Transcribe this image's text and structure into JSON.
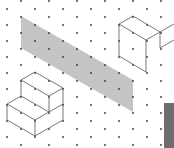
{
  "diagram": {
    "type": "isometric-dot-grid",
    "background": "#ffffff",
    "dot_color": "#333333",
    "line_color": "#555555",
    "shade_color": "#c4c4c4",
    "side_panel_color": "#6e6e6e",
    "grid": {
      "col_spacing": 14,
      "row_spacing": 16,
      "x0": 7,
      "y0": 9
    },
    "shapes": [
      {
        "name": "shaded-parallelogram",
        "kind": "polygon",
        "fill": "#c4c4c4",
        "points": [
          [
            21,
            16
          ],
          [
            133,
            80
          ],
          [
            133,
            112
          ],
          [
            21,
            48
          ]
        ]
      },
      {
        "name": "cube",
        "kind": "wireframe",
        "lines": [
          [
            [
              119,
              24
            ],
            [
              133,
              16
            ]
          ],
          [
            [
              133,
              16
            ],
            [
              160,
              32
            ]
          ],
          [
            [
              119,
              24
            ],
            [
              146,
              40
            ]
          ],
          [
            [
              146,
              40
            ],
            [
              160,
              32
            ]
          ],
          [
            [
              119,
              24
            ],
            [
              119,
              56
            ]
          ],
          [
            [
              146,
              40
            ],
            [
              146,
              72
            ]
          ],
          [
            [
              119,
              56
            ],
            [
              146,
              72
            ]
          ],
          [
            [
              160,
              32
            ],
            [
              174,
              24
            ]
          ],
          [
            [
              160,
              32
            ],
            [
              160,
              48
            ]
          ],
          [
            [
              160,
              48
            ],
            [
              174,
              40
            ]
          ]
        ]
      },
      {
        "name": "staircase",
        "kind": "wireframe",
        "lines": [
          [
            [
              21,
              80
            ],
            [
              35,
              72
            ]
          ],
          [
            [
              35,
              72
            ],
            [
              63,
              88
            ]
          ],
          [
            [
              21,
              80
            ],
            [
              49,
              96
            ]
          ],
          [
            [
              49,
              96
            ],
            [
              63,
              88
            ]
          ],
          [
            [
              21,
              80
            ],
            [
              21,
              96
            ]
          ],
          [
            [
              49,
              96
            ],
            [
              49,
              112
            ]
          ],
          [
            [
              63,
              88
            ],
            [
              63,
              104
            ]
          ],
          [
            [
              7,
              104
            ],
            [
              21,
              96
            ]
          ],
          [
            [
              7,
              104
            ],
            [
              7,
              120
            ]
          ],
          [
            [
              21,
              96
            ],
            [
              35,
              104
            ]
          ],
          [
            [
              7,
              104
            ],
            [
              35,
              120
            ]
          ],
          [
            [
              35,
              120
            ],
            [
              49,
              112
            ]
          ],
          [
            [
              35,
              104
            ],
            [
              49,
              112
            ]
          ],
          [
            [
              35,
              120
            ],
            [
              35,
              136
            ]
          ],
          [
            [
              7,
              120
            ],
            [
              35,
              136
            ]
          ],
          [
            [
              35,
              136
            ],
            [
              63,
              120
            ]
          ],
          [
            [
              63,
              104
            ],
            [
              63,
              120
            ]
          ],
          [
            [
              49,
              112
            ],
            [
              63,
              104
            ]
          ]
        ]
      },
      {
        "name": "side-panel",
        "kind": "rect",
        "fill": "#6e6e6e",
        "x": 164,
        "y": 103,
        "width": 10,
        "height": 45
      }
    ]
  }
}
